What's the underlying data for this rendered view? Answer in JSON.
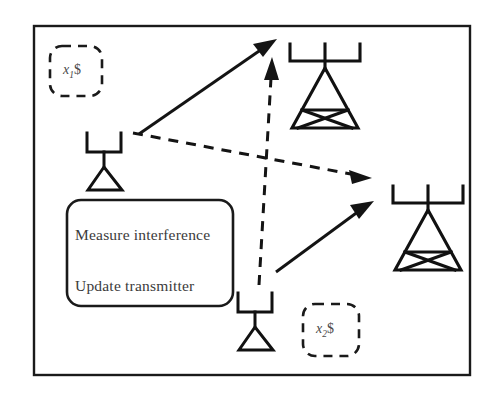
{
  "figure": {
    "kind": "wireless-interference-diagram",
    "background_color": "#ffffff",
    "ink_color": "#141414",
    "frame": {
      "x": 34,
      "y": 26,
      "width": 436,
      "height": 349
    }
  },
  "process_box": {
    "name": "algorithm-box",
    "x": 67,
    "y": 200,
    "width": 166,
    "height": 106,
    "corner_radius": 14,
    "lines": [
      "Measure interference",
      "Update transmitter"
    ]
  },
  "variable_labels": [
    {
      "id": "x1",
      "text": "x",
      "subscript": "1",
      "suffix": "$",
      "box": {
        "x": 50,
        "y": 46,
        "width": 52,
        "height": 50,
        "corner_radius": 12
      }
    },
    {
      "id": "x2",
      "text": "x",
      "subscript": "2",
      "suffix": "$",
      "box": {
        "x": 303,
        "y": 304,
        "width": 56,
        "height": 52,
        "corner_radius": 12
      }
    }
  ],
  "towers": [
    {
      "id": "tower-1",
      "role": "base-station-upper",
      "center_x": 325,
      "top_y": 42,
      "mast_height": 86,
      "crossbar_half_width": 35
    },
    {
      "id": "tower-2",
      "role": "base-station-lower",
      "center_x": 428,
      "top_y": 184,
      "mast_height": 86,
      "crossbar_half_width": 35
    }
  ],
  "antennas": [
    {
      "id": "antenna-1",
      "role": "receiver-upper-left",
      "center_x": 104,
      "top_y": 133
    },
    {
      "id": "antenna-2",
      "role": "receiver-lower-center",
      "center_x": 255,
      "top_y": 293
    }
  ],
  "links": [
    {
      "id": "signal-1",
      "kind": "signal",
      "style": "solid",
      "from": "antenna-1",
      "to": "tower-1",
      "start": {
        "x": 139,
        "y": 134
      },
      "end": {
        "x": 274,
        "y": 41
      }
    },
    {
      "id": "signal-2",
      "kind": "signal",
      "style": "solid",
      "from": "antenna-2",
      "to": "tower-2",
      "start": {
        "x": 276,
        "y": 272
      },
      "end": {
        "x": 372,
        "y": 202
      }
    },
    {
      "id": "interference-1",
      "kind": "interference",
      "style": "dashed",
      "from": "antenna-1",
      "to": "tower-2",
      "start": {
        "x": 133,
        "y": 133
      },
      "end": {
        "x": 369,
        "y": 178
      }
    },
    {
      "id": "interference-2",
      "kind": "interference",
      "style": "dashed",
      "from": "antenna-2",
      "to": "tower-1",
      "start": {
        "x": 260,
        "y": 283
      },
      "end": {
        "x": 272,
        "y": 62
      }
    }
  ],
  "legend_semantics": {
    "solid_arrow_meaning": "desired signal link",
    "dashed_arrow_meaning": "interference link"
  }
}
